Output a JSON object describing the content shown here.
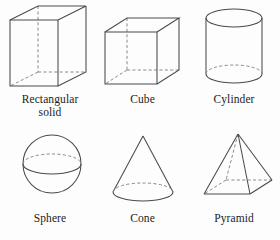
{
  "page": {
    "background_color": "#fdfdfd",
    "line_color": "#4a4a4a",
    "hidden_line_color": "#8a8a8a",
    "text_color": "#1c1c1c",
    "width": 280,
    "height": 240
  },
  "figures": [
    {
      "id": "rectangular-solid",
      "label": "Rectangular\nsolid",
      "label_lines": [
        "Rectangular",
        "solid"
      ],
      "shape_type": "rectangular-solid",
      "row": 1,
      "column": 1
    },
    {
      "id": "cube",
      "label": "Cube",
      "label_lines": [
        "Cube"
      ],
      "shape_type": "cube",
      "row": 1,
      "column": 2
    },
    {
      "id": "cylinder",
      "label": "Cylinder",
      "label_lines": [
        "Cylinder"
      ],
      "shape_type": "cylinder",
      "row": 1,
      "column": 3
    },
    {
      "id": "sphere",
      "label": "Sphere",
      "label_lines": [
        "Sphere"
      ],
      "shape_type": "sphere",
      "row": 2,
      "column": 1
    },
    {
      "id": "cone",
      "label": "Cone",
      "label_lines": [
        "Cone"
      ],
      "shape_type": "cone",
      "row": 2,
      "column": 2
    },
    {
      "id": "pyramid",
      "label": "Pyramid",
      "label_lines": [
        "Pyramid"
      ],
      "shape_type": "pyramid",
      "row": 2,
      "column": 3
    }
  ]
}
